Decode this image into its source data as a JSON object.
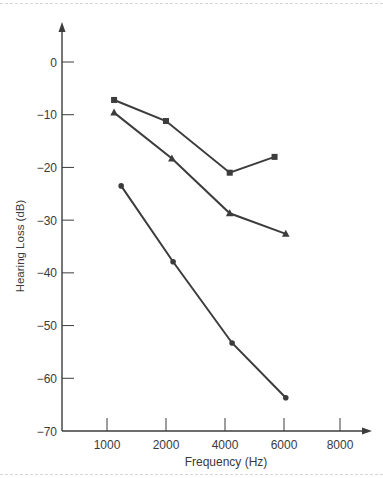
{
  "chart_data": {
    "type": "line",
    "title": "",
    "xlabel": "Frequency (Hz)",
    "ylabel": "Hearing Loss (dB)",
    "x_ticks": [
      "1000",
      "2000",
      "4000",
      "6000",
      "8000"
    ],
    "y_ticks": [
      0,
      -10,
      -20,
      -30,
      -40,
      -50,
      -60,
      -70
    ],
    "ylim": [
      -70,
      7
    ],
    "grid": false,
    "legend": "none",
    "series": [
      {
        "name": "square",
        "marker": "square",
        "points": [
          {
            "x": "1000",
            "y": -7.2
          },
          {
            "x": "2000",
            "y": -11.2
          },
          {
            "x": "4000",
            "y": -21
          },
          {
            "x": "6000",
            "y": -18
          }
        ],
        "x_offsets": [
          0.12,
          0.0,
          0.08,
          -0.16
        ]
      },
      {
        "name": "triangle",
        "marker": "triangle",
        "points": [
          {
            "x": "1000",
            "y": -9.6
          },
          {
            "x": "2000",
            "y": -18.3
          },
          {
            "x": "4000",
            "y": -28.7
          },
          {
            "x": "6000",
            "y": -32.6
          }
        ],
        "x_offsets": [
          0.12,
          0.1,
          0.08,
          0.03
        ]
      },
      {
        "name": "circle",
        "marker": "circle",
        "points": [
          {
            "x": "1000",
            "y": -23.5
          },
          {
            "x": "2000",
            "y": -37.9
          },
          {
            "x": "4000",
            "y": -53.3
          },
          {
            "x": "6000",
            "y": -63.7
          }
        ],
        "x_offsets": [
          0.24,
          0.12,
          0.12,
          0.03
        ]
      }
    ],
    "colors": {
      "line": "#3c3c3c",
      "text": "#3a3a3a"
    }
  }
}
